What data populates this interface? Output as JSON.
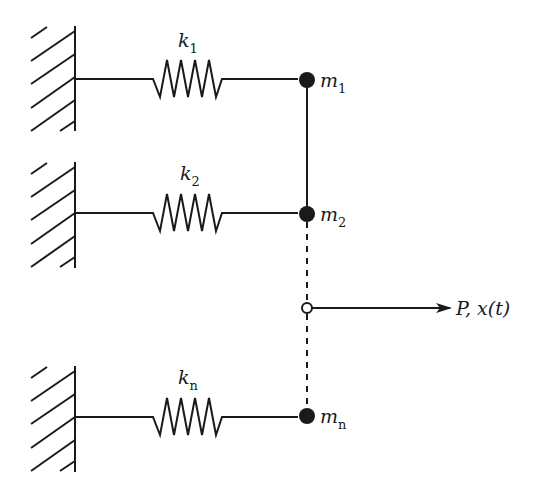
{
  "diagram": {
    "type": "parallel spring-mass system",
    "colors": {
      "stroke": "#1a1a1a",
      "background": "#ffffff"
    },
    "rows": [
      {
        "spring_label": "k",
        "spring_sub": "1",
        "mass_label": "m",
        "mass_sub": "1",
        "y": 80,
        "wall_top": 26,
        "wall_bottom": 131
      },
      {
        "spring_label": "k",
        "spring_sub": "2",
        "mass_label": "m",
        "mass_sub": "2",
        "y": 214,
        "wall_top": 162,
        "wall_bottom": 268
      },
      {
        "spring_label": "k",
        "spring_sub": "n",
        "mass_label": "m",
        "mass_sub": "n",
        "y": 417,
        "wall_top": 366,
        "wall_bottom": 472
      }
    ],
    "load": {
      "label": "P, x(t)",
      "y": 308
    }
  }
}
